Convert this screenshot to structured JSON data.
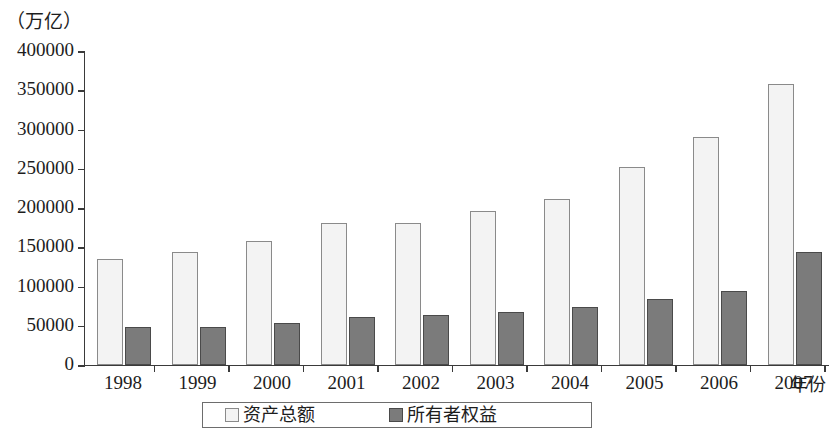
{
  "chart_data": {
    "type": "bar",
    "title": "",
    "unit_label": "（万亿）",
    "xlabel": "年份",
    "ylabel": "",
    "categories": [
      "1998",
      "1999",
      "2000",
      "2001",
      "2002",
      "2003",
      "2004",
      "2005",
      "2006",
      "2007"
    ],
    "series": [
      {
        "name": "资产总额",
        "color": "#f3f3f3",
        "border_color": "#8a8a8a",
        "values": [
          135000,
          144000,
          158000,
          181000,
          181000,
          196000,
          211000,
          252000,
          291000,
          358000
        ]
      },
      {
        "name": "所有者权益",
        "color": "#7b7b7b",
        "border_color": "#4a4a4a",
        "values": [
          49000,
          48000,
          54000,
          61000,
          64000,
          67000,
          74000,
          84000,
          94000,
          144000
        ]
      }
    ],
    "ylim": [
      0,
      400000
    ],
    "y_ticks": [
      "400000",
      "350000",
      "300000",
      "250000",
      "200000",
      "150000",
      "100000",
      "50000",
      "0"
    ],
    "y_tick_values": [
      400000,
      350000,
      300000,
      250000,
      200000,
      150000,
      100000,
      50000,
      0
    ],
    "grid": false,
    "legend_position": "bottom"
  }
}
